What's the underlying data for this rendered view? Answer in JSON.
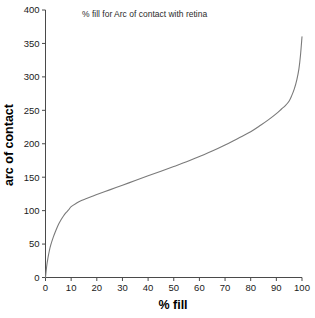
{
  "chart_data": {
    "type": "line",
    "title": "% fill for Arc of contact with retina",
    "xlabel": "% fill",
    "ylabel": "arc of contact",
    "xlim": [
      0,
      100
    ],
    "ylim": [
      0,
      400
    ],
    "grid": false,
    "legend": null,
    "line_color": "#7a7a7a",
    "xticks": [
      0,
      10,
      20,
      30,
      40,
      50,
      60,
      70,
      80,
      90,
      100
    ],
    "yticks": [
      0,
      50,
      100,
      150,
      200,
      250,
      300,
      350,
      400
    ],
    "xtick_labels": [
      "0",
      "10",
      "20",
      "30",
      "40",
      "50",
      "60",
      "70",
      "80",
      "90",
      "100"
    ],
    "ytick_labels": [
      "0",
      "50",
      "100",
      "150",
      "200",
      "250",
      "300",
      "350",
      "400"
    ],
    "series": [
      {
        "name": "arc of contact",
        "x": [
          0,
          0.5,
          1,
          1.5,
          2,
          3,
          4,
          5,
          6,
          7,
          8,
          9,
          10,
          12,
          14,
          16,
          18,
          20,
          25,
          30,
          35,
          40,
          45,
          50,
          55,
          60,
          65,
          70,
          75,
          80,
          84,
          87,
          90,
          92,
          93.5,
          95,
          96,
          97,
          98,
          98.8,
          99.4,
          100
        ],
        "y": [
          0,
          18,
          30,
          40,
          48,
          60,
          70,
          79,
          86,
          92,
          97,
          101,
          106,
          111,
          115,
          118,
          121,
          124,
          131,
          138,
          145,
          152,
          159,
          166,
          173,
          181,
          189,
          198,
          208,
          218,
          228,
          236,
          245,
          252,
          257,
          264,
          272,
          282,
          296,
          312,
          332,
          360
        ]
      }
    ]
  },
  "title_text": "% fill for Arc of contact with retina",
  "axes": {
    "x_title": "% fill",
    "y_title": "arc of contact"
  }
}
